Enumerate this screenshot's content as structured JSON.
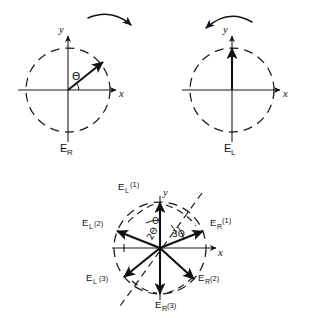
{
  "figure": {
    "background_color": "#ffffff",
    "ink_color": "#111111"
  },
  "panels": [
    {
      "id": "panel-right-circular",
      "caption_base": "E",
      "caption_sub": "R",
      "caption_full": "E_R",
      "center": {
        "x": 68,
        "y": 90
      },
      "radius": 42,
      "axis_x_label": "x",
      "axis_y_label": "y",
      "angle_label": "Θ",
      "rotation_sense": "clockwise",
      "vector": {
        "angle_deg": 38,
        "label": ""
      }
    },
    {
      "id": "panel-left-circular",
      "caption_base": "E",
      "caption_sub": "L",
      "caption_full": "E_L",
      "center": {
        "x": 232,
        "y": 90
      },
      "radius": 42,
      "axis_x_label": "x",
      "axis_y_label": "y",
      "angle_label": "",
      "rotation_sense": "counterclockwise",
      "vector": {
        "angle_deg": 90,
        "label": ""
      }
    }
  ],
  "composite": {
    "id": "panel-composite",
    "center": {
      "x": 160,
      "y": 248
    },
    "radius": 46,
    "axis_x_label": "x",
    "axis_y_label": "y",
    "angle_labels": [
      "Θ",
      "2Θ",
      "3Θ"
    ],
    "dashed_guide_angle_deg": 58,
    "vectors": [
      {
        "id": "EL1",
        "base": "E",
        "sub": "L",
        "arg": "(1)",
        "angle_deg": 90,
        "label_x": 118,
        "label_y": 188,
        "anchor": "start"
      },
      {
        "id": "ER1",
        "base": "E",
        "sub": "R",
        "arg": "(1)",
        "angle_deg": 22,
        "label_x": 212,
        "label_y": 222,
        "anchor": "start"
      },
      {
        "id": "EL2",
        "base": "E",
        "sub": "L",
        "arg": "(2)",
        "angle_deg": 158,
        "label_x": 86,
        "label_y": 222,
        "anchor": "start"
      },
      {
        "id": "ER2",
        "base": "E",
        "sub": "R",
        "arg": "(2)",
        "angle_deg": -42,
        "label_x": 208,
        "label_y": 275,
        "anchor": "start"
      },
      {
        "id": "EL3",
        "base": "E",
        "sub": "L",
        "arg": "(3)",
        "angle_deg": 218,
        "label_x": 90,
        "label_y": 276,
        "anchor": "start"
      },
      {
        "id": "ER3",
        "base": "E",
        "sub": "R",
        "arg": "(3)",
        "angle_deg": 270,
        "label_x": 155,
        "label_y": 305,
        "anchor": "start"
      }
    ]
  }
}
